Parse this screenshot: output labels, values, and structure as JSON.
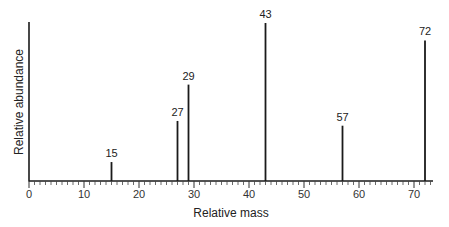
{
  "chart_data": {
    "type": "bar",
    "subtype": "mass-spectrum-stick",
    "title": "",
    "xlabel": "Relative mass",
    "ylabel": "Relative abundance",
    "xlim": [
      0,
      73
    ],
    "ylim": [
      0,
      100
    ],
    "x_ticks": [
      0,
      10,
      20,
      30,
      40,
      50,
      60,
      70
    ],
    "minor_tick_step": 1,
    "grid": false,
    "legend": null,
    "peaks": [
      {
        "mz": 15,
        "label": "15",
        "abundance": 12
      },
      {
        "mz": 27,
        "label": "27",
        "abundance": 38
      },
      {
        "mz": 29,
        "label": "29",
        "abundance": 61
      },
      {
        "mz": 43,
        "label": "43",
        "abundance": 100
      },
      {
        "mz": 57,
        "label": "57",
        "abundance": 35
      },
      {
        "mz": 72,
        "label": "72",
        "abundance": 89
      }
    ],
    "colors": {
      "line": "#1a1a1a",
      "text": "#222222"
    }
  }
}
